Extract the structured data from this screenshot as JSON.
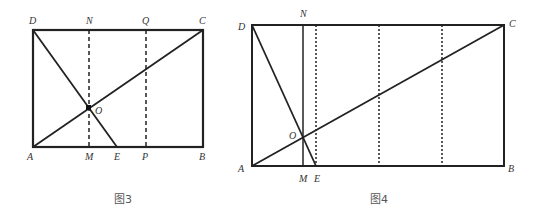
{
  "figures": [
    {
      "caption": "图3",
      "points": {
        "A": "A",
        "B": "B",
        "C": "C",
        "D": "D",
        "N": "N",
        "Q": "Q",
        "O": "O",
        "M": "M",
        "E": "E",
        "P": "P"
      },
      "rect": {
        "x1": 33,
        "y1": 30,
        "x2": 203,
        "y2": 147
      },
      "segments": [
        "AB",
        "BC",
        "CD",
        "DA",
        "AC",
        "DE"
      ],
      "dashed_lines": [
        "NM",
        "QP"
      ]
    },
    {
      "caption": "图4",
      "points": {
        "A": "A",
        "B": "B",
        "C": "C",
        "D": "D",
        "N": "N",
        "O": "O",
        "M": "M",
        "E": "E"
      },
      "rect": {
        "x1": 252,
        "y1": 25,
        "x2": 504,
        "y2": 166
      },
      "segments": [
        "AB",
        "BC",
        "CD",
        "DA",
        "AC",
        "DE",
        "NM"
      ],
      "dotted_lines_count": 3
    }
  ]
}
